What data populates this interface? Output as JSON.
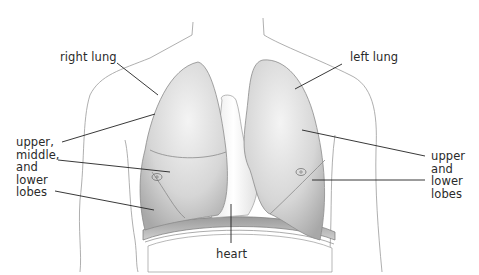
{
  "diagram": {
    "type": "anatomical-illustration",
    "labels": {
      "right_lung": "right lung",
      "left_lung": "left lung",
      "right_lobes": "upper,\nmiddle,\nand\nlower\nlobes",
      "left_lobes": "upper\nand\nlower\nlobes",
      "heart": "heart"
    },
    "colors": {
      "lung_light": "#f2f2f2",
      "lung_dark": "#a9a9a9",
      "outline": "#8c8c8c",
      "leader_line": "#222222",
      "text": "#2a2a2a"
    }
  }
}
